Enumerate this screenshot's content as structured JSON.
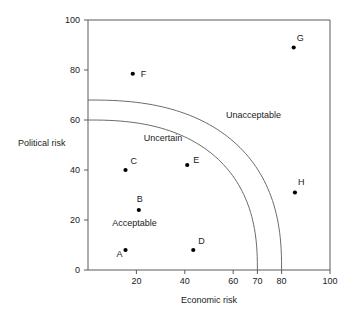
{
  "chart_data": {
    "type": "scatter",
    "title": "",
    "xlabel": "Economic risk",
    "ylabel": "Political risk",
    "xlim": [
      0,
      100
    ],
    "ylim": [
      0,
      100
    ],
    "grid": false,
    "legend": "none",
    "xticks": [
      20,
      40,
      60,
      70,
      80,
      100
    ],
    "xtick_labels": [
      "20",
      "40",
      "60",
      "70",
      "80",
      "100"
    ],
    "yticks": [
      0,
      20,
      40,
      60,
      80,
      100
    ],
    "ytick_labels": [
      "0",
      "20",
      "40",
      "60",
      "80",
      "100"
    ],
    "points": [
      {
        "label": "A",
        "x": 15.5,
        "y": 8,
        "label_dx": -9,
        "label_dy": 4
      },
      {
        "label": "B",
        "x": 21,
        "y": 24,
        "label_dx": -2,
        "label_dy": -11
      },
      {
        "label": "C",
        "x": 15.5,
        "y": 40,
        "label_dx": 5,
        "label_dy": -9
      },
      {
        "label": "D",
        "x": 43.5,
        "y": 8,
        "label_dx": 5,
        "label_dy": -9
      },
      {
        "label": "E",
        "x": 41,
        "y": 42,
        "label_dx": 6,
        "label_dy": -5
      },
      {
        "label": "F",
        "x": 18.5,
        "y": 78.5,
        "label_dx": 8,
        "label_dy": 0
      },
      {
        "label": "G",
        "x": 85,
        "y": 89,
        "label_dx": 3,
        "label_dy": -10
      },
      {
        "label": "H",
        "x": 85.5,
        "y": 31,
        "label_dx": 3,
        "label_dy": -11
      }
    ],
    "regions": [
      {
        "name": "Acceptable",
        "x": 10,
        "y": 19
      },
      {
        "name": "Uncertain",
        "x": 23,
        "y": 53
      },
      {
        "name": "Unacceptable",
        "x": 57,
        "y": 62
      }
    ],
    "boundaries": [
      {
        "name": "upper-boundary",
        "note": "outer curve separating Uncertain from Unacceptable",
        "x_intercept": 80,
        "y_intercept": 68
      },
      {
        "name": "lower-boundary",
        "note": "inner curve separating Acceptable from Uncertain",
        "x_intercept": 70,
        "y_intercept": 60
      }
    ]
  },
  "colors": {
    "axis": "#5a5a5a",
    "curve": "#6b6b6b",
    "point": "#000000",
    "text": "#1a1a1a",
    "background": "#ffffff"
  }
}
